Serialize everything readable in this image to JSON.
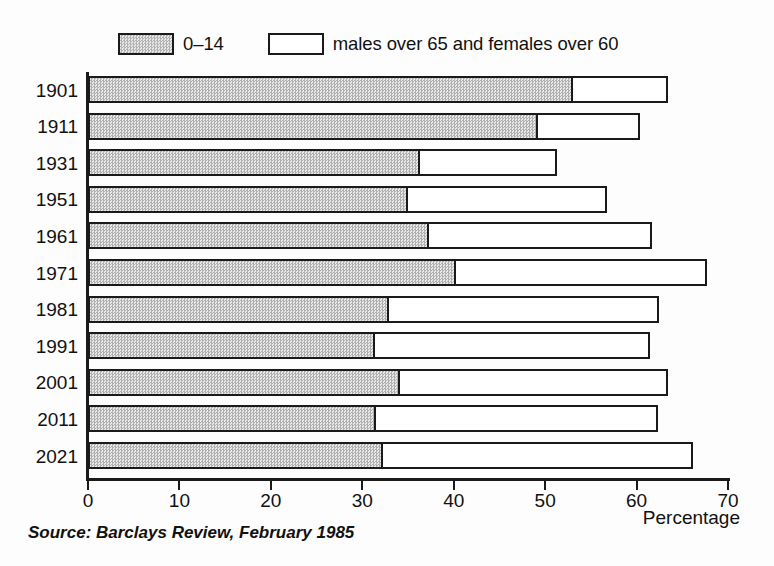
{
  "legend": {
    "entries": [
      {
        "label": "0–14",
        "swatch": "gray"
      },
      {
        "label": "males over 65 and females over 60",
        "swatch": "white"
      }
    ]
  },
  "axis": {
    "x_title": "Percentage",
    "x_ticks": [
      "0",
      "10",
      "20",
      "30",
      "40",
      "50",
      "60",
      "70"
    ]
  },
  "source": "Source: Barclays Review, February 1985",
  "colors": {
    "ink": "#1a1a1a",
    "young_fill": "#c9c9c9",
    "old_fill": "#ffffff",
    "background": "#ffffff"
  },
  "chart_data": {
    "type": "bar",
    "orientation": "horizontal",
    "stacked": true,
    "title": "",
    "subtitle": "",
    "xlabel": "Percentage",
    "ylabel": "",
    "xlim": [
      0,
      70
    ],
    "xticks": [
      0,
      10,
      20,
      30,
      40,
      50,
      60,
      70
    ],
    "grid": false,
    "legend_position": "top-left",
    "categories": [
      "1901",
      "1911",
      "1931",
      "1951",
      "1961",
      "1971",
      "1981",
      "1991",
      "2001",
      "2011",
      "2021"
    ],
    "series": [
      {
        "name": "0–14",
        "values": [
          53.1,
          49.2,
          36.3,
          35.0,
          37.3,
          40.3,
          32.9,
          31.4,
          34.1,
          31.5,
          32.3
        ]
      },
      {
        "name": "males over 65 and females over 60",
        "values": [
          10.3,
          11.2,
          15.0,
          21.8,
          24.4,
          27.4,
          29.5,
          30.1,
          29.3,
          30.8,
          33.9
        ]
      }
    ],
    "totals": [
      63.4,
      60.4,
      51.3,
      56.8,
      61.7,
      67.7,
      62.4,
      61.5,
      63.4,
      62.3,
      66.2
    ],
    "source": "Source: Barclays Review, February 1985"
  }
}
